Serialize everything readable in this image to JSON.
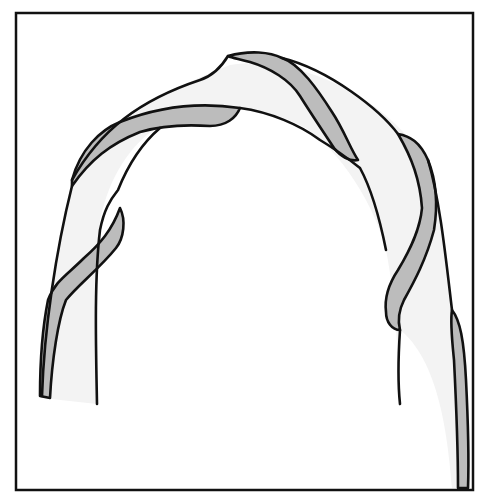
{
  "figure": {
    "colors": {
      "frame_stroke": "#111111",
      "band_fill": "#f3f3f3",
      "stripe_fill": "#bcbcbc",
      "background": "#ffffff"
    }
  }
}
